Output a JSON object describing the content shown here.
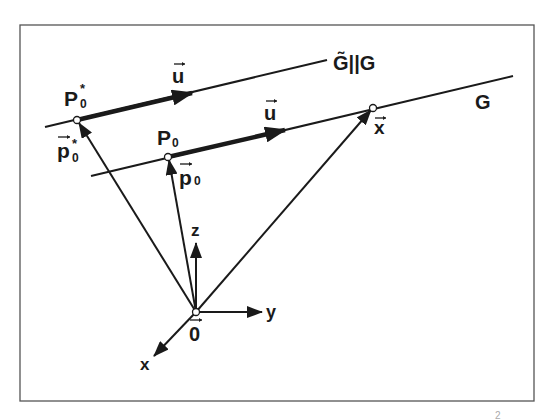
{
  "figure": {
    "line_upper_label": "G̃||G",
    "line_lower_label": "G",
    "point_upper": {
      "label": "P",
      "sub": "0",
      "sup": "*"
    },
    "point_lower": {
      "label": "P",
      "sub": "0"
    },
    "vector_p0_star": {
      "label": "p",
      "sub": "0",
      "sup": "*"
    },
    "vector_p0": {
      "label": "p",
      "sub": "0"
    },
    "direction_upper": {
      "label": "u"
    },
    "direction_lower": {
      "label": "u"
    },
    "vector_x": {
      "label": "x"
    },
    "origin": {
      "label": "0"
    },
    "axes": {
      "x": "x",
      "y": "y",
      "z": "z"
    },
    "corner_mark": "2"
  },
  "colors": {
    "ink": "#1a1a1a",
    "frame": "#555555",
    "background": "#ffffff"
  }
}
